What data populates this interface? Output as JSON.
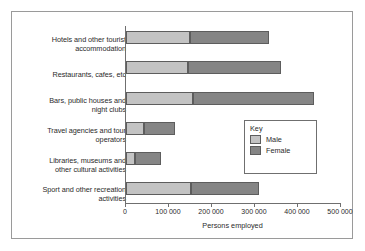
{
  "chart_data": {
    "type": "bar",
    "orientation": "horizontal",
    "stacked": true,
    "title": "",
    "xlabel": "Persons employed",
    "ylabel": "",
    "xlim": [
      0,
      500000
    ],
    "xticks": [
      0,
      100000,
      200000,
      300000,
      400000,
      500000
    ],
    "xtick_labels": [
      "0",
      "100 000",
      "200 000",
      "300 000",
      "400 000",
      "500 000"
    ],
    "grid": false,
    "legend_position": "inside-right",
    "legend_title": "Key",
    "categories": [
      "Hotels and other tourist\naccommodation",
      "Restaurants, cafes, etc",
      "Bars, public houses and\nnight clubs",
      "Travel agencies and tour\noperators",
      "Libraries, museums and\nother cultural activities",
      "Sport and other recreation\nactivities"
    ],
    "series": [
      {
        "name": "Male",
        "color": "#c3c3c3",
        "values": [
          148000,
          145000,
          155000,
          42000,
          22000,
          150000
        ]
      },
      {
        "name": "Female",
        "color": "#858585",
        "values": [
          185000,
          215000,
          283000,
          73000,
          60000,
          160000
        ]
      }
    ],
    "totals": [
      333000,
      360000,
      438000,
      115000,
      82000,
      310000
    ]
  },
  "legend": {
    "title": "Key",
    "items": [
      {
        "label": "Male",
        "color": "#c3c3c3"
      },
      {
        "label": "Female",
        "color": "#858585"
      }
    ]
  },
  "axis": {
    "x_title": "Persons employed"
  }
}
